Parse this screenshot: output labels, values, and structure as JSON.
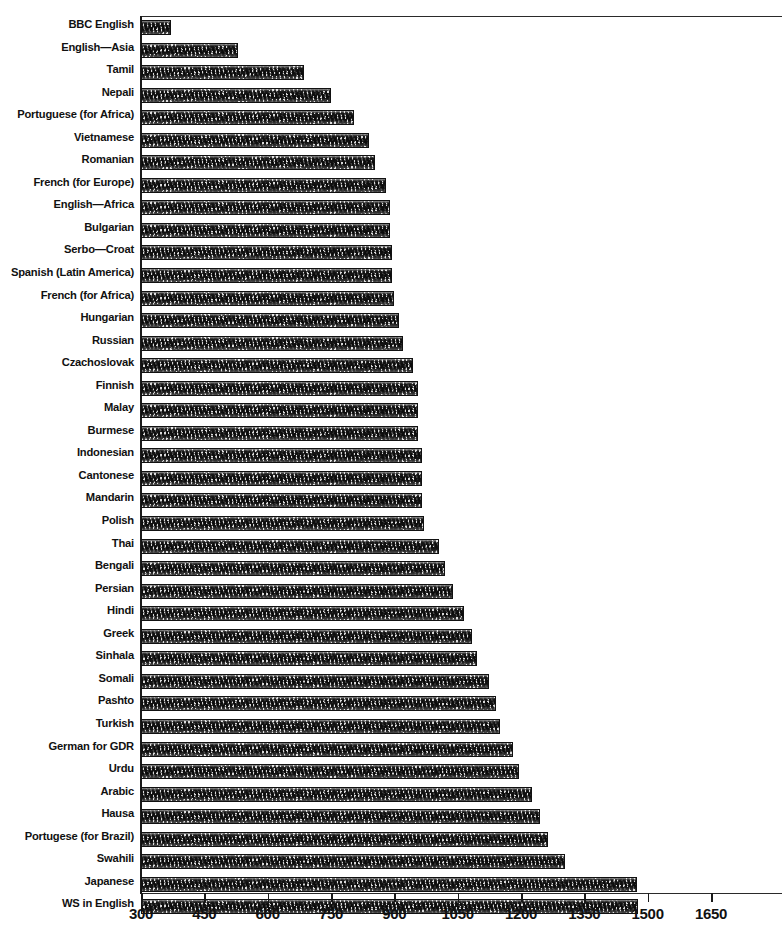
{
  "chart_data": {
    "type": "bar",
    "orientation": "horizontal",
    "title": "",
    "subtitle": "",
    "xlabel": "",
    "ylabel": "",
    "xlim": [
      300,
      1720
    ],
    "ylim": null,
    "grid": false,
    "legend": null,
    "axis_ticks": [
      300,
      450,
      600,
      750,
      900,
      1050,
      1200,
      1350,
      1500,
      1650
    ],
    "tick_step": 150,
    "bar_fill": "hatched-halftone",
    "bar_edge_color": "#111111",
    "categories": [
      "BBC English",
      "English—Asia",
      "Tamil",
      "Nepali",
      "Portuguese (for Africa)",
      "Vietnamese",
      "Romanian",
      "French (for Europe)",
      "English—Africa",
      "Bulgarian",
      "Serbo—Croat",
      "Spanish (Latin America)",
      "French (for Africa)",
      "Hungarian",
      "Russian",
      "Czachoslovak",
      "Finnish",
      "Malay",
      "Burmese",
      "Indonesian",
      "Cantonese",
      "Mandarin",
      "Polish",
      "Thai",
      "Bengali",
      "Persian",
      "Hindi",
      "Greek",
      "Sinhala",
      "Somali",
      "Pashto",
      "Turkish",
      "German for GDR",
      "Urdu",
      "Arabic",
      "Hausa",
      "Portugese (for Brazil)",
      "Swahili",
      "Japanese",
      "WS in English"
    ],
    "values": [
      372,
      530,
      685,
      750,
      805,
      840,
      855,
      880,
      890,
      890,
      895,
      895,
      900,
      910,
      920,
      945,
      955,
      955,
      955,
      965,
      965,
      965,
      970,
      1005,
      1020,
      1040,
      1065,
      1085,
      1095,
      1125,
      1140,
      1150,
      1180,
      1195,
      1225,
      1245,
      1265,
      1305,
      1475,
      1478
    ]
  }
}
